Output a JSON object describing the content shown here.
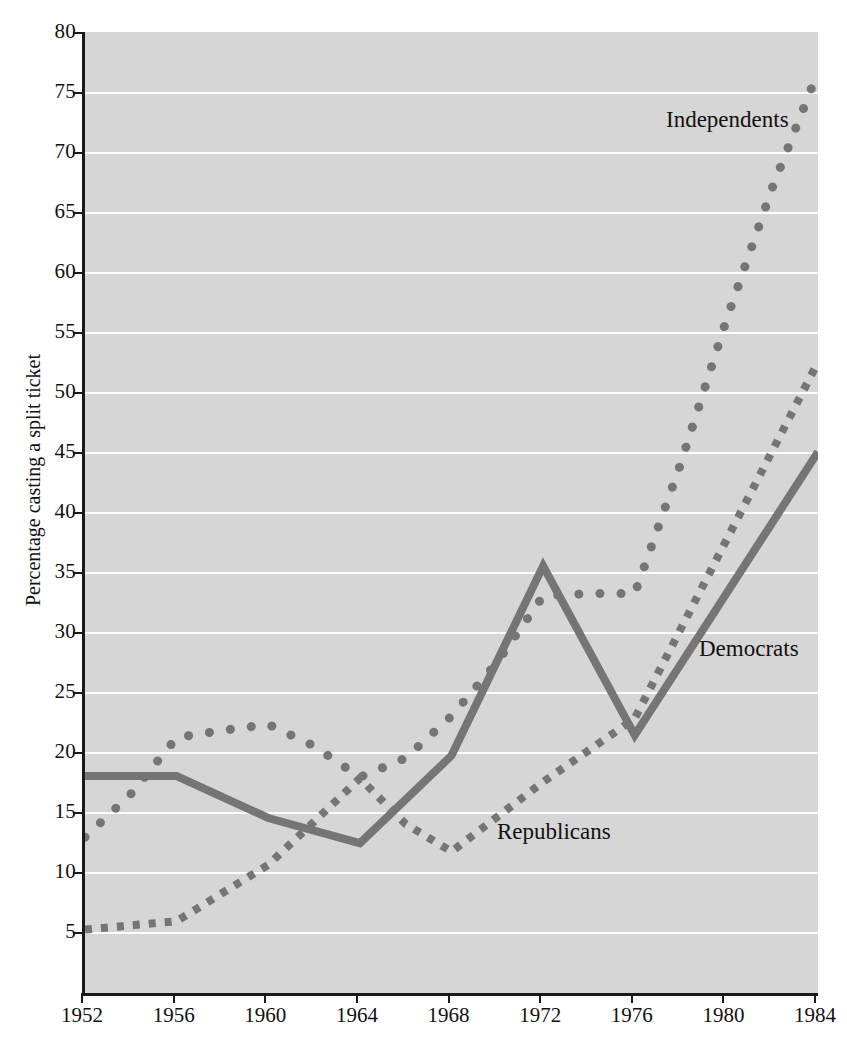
{
  "chart_data": {
    "type": "line",
    "title": "",
    "xlabel": "",
    "ylabel": "Percentage casting a split ticket",
    "x": [
      1952,
      1956,
      1960,
      1964,
      1968,
      1972,
      1976,
      1980,
      1984
    ],
    "xlim": [
      1952,
      1984
    ],
    "ylim": [
      0,
      80
    ],
    "yticks": [
      5,
      10,
      15,
      20,
      25,
      30,
      35,
      40,
      45,
      50,
      55,
      60,
      65,
      70,
      75,
      80
    ],
    "xticks": [
      1952,
      1956,
      1960,
      1964,
      1968,
      1972,
      1976,
      1980,
      1984
    ],
    "grid": true,
    "legend_position": "inline-annotations",
    "series": [
      {
        "name": "Independents",
        "style": "dotted",
        "color": "#757575",
        "label_text": "Independents",
        "points": [
          {
            "x": 1952,
            "y": 12.9
          },
          {
            "x": 1954,
            "y": 16.5
          },
          {
            "x": 1956,
            "y": 21.2
          },
          {
            "x": 1958,
            "y": 21.8
          },
          {
            "x": 1960,
            "y": 22.3
          },
          {
            "x": 1962,
            "y": 20.5
          },
          {
            "x": 1964,
            "y": 17.9
          },
          {
            "x": 1966,
            "y": 19.5
          },
          {
            "x": 1968,
            "y": 23.0
          },
          {
            "x": 1970,
            "y": 27.5
          },
          {
            "x": 1972,
            "y": 33.0
          },
          {
            "x": 1974,
            "y": 33.2
          },
          {
            "x": 1976,
            "y": 33.2
          },
          {
            "x": 1978,
            "y": 44.0
          },
          {
            "x": 1980,
            "y": 56.0
          },
          {
            "x": 1982,
            "y": 67.0
          },
          {
            "x": 1984,
            "y": 76.7
          }
        ]
      },
      {
        "name": "Democrats",
        "style": "solid",
        "color": "#757575",
        "label_text": "Democrats",
        "points": [
          {
            "x": 1952,
            "y": 18.0
          },
          {
            "x": 1956,
            "y": 18.0
          },
          {
            "x": 1960,
            "y": 14.5
          },
          {
            "x": 1964,
            "y": 12.4
          },
          {
            "x": 1968,
            "y": 19.7
          },
          {
            "x": 1972,
            "y": 35.5
          },
          {
            "x": 1976,
            "y": 21.4
          },
          {
            "x": 1984,
            "y": 45.0
          }
        ]
      },
      {
        "name": "Republicans",
        "style": "dashed",
        "color": "#757575",
        "label_text": "Republicans",
        "points": [
          {
            "x": 1952,
            "y": 5.2
          },
          {
            "x": 1956,
            "y": 5.9
          },
          {
            "x": 1960,
            "y": 10.6
          },
          {
            "x": 1964,
            "y": 17.8
          },
          {
            "x": 1966,
            "y": 14.0
          },
          {
            "x": 1968,
            "y": 11.7
          },
          {
            "x": 1972,
            "y": 17.5
          },
          {
            "x": 1976,
            "y": 22.8
          },
          {
            "x": 1984,
            "y": 52.5
          }
        ]
      }
    ]
  },
  "axis": {
    "y_title": "Percentage casting a split ticket",
    "y_tick_labels": [
      "5",
      "10",
      "15",
      "20",
      "25",
      "30",
      "35",
      "40",
      "45",
      "50",
      "55",
      "60",
      "65",
      "70",
      "75",
      "80"
    ],
    "x_tick_labels": [
      "1952",
      "1956",
      "1960",
      "1964",
      "1968",
      "1972",
      "1976",
      "1980",
      "1984"
    ]
  },
  "colors": {
    "plot_background": "#d6d6d6",
    "gridline": "#fdfdfd",
    "axis": "#1a1a1a",
    "series": "#757575",
    "text": "#111111"
  },
  "annotations": {
    "independents": "Independents",
    "democrats": "Democrats",
    "republicans": "Republicans"
  }
}
